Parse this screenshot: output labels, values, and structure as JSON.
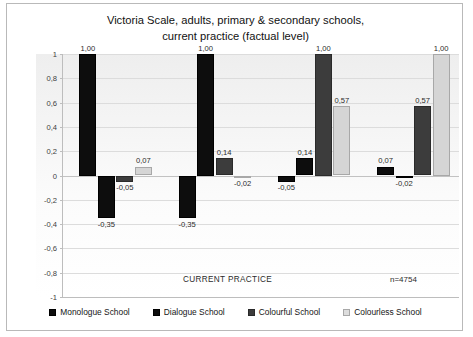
{
  "chart_data": {
    "type": "bar",
    "title": "Victoria Scale, adults, primary & secondary schools, current practice (factual level)",
    "title_lines": [
      "Victoria Scale, adults, primary & secondary schools,",
      "current practice (factual level)"
    ],
    "xlabel": "",
    "ylabel": "",
    "ylim": [
      -1,
      1
    ],
    "ytick_labels": [
      "1",
      "0,8",
      "0,6",
      "0,4",
      "0,2",
      "0",
      "-0,2",
      "-0,4",
      "-0,6",
      "-0,8",
      "-1"
    ],
    "ytick_values": [
      1,
      0.8,
      0.6,
      0.4,
      0.2,
      0,
      -0.2,
      -0.4,
      -0.6,
      -0.8,
      -1
    ],
    "grid": true,
    "legend_position": "bottom",
    "categories": [
      "Monologue School",
      "Dialogue School",
      "Colourful School",
      "Colourless School"
    ],
    "series": [
      {
        "name": "Monologue School",
        "color": "#0d0d0d",
        "values": [
          1.0,
          -0.35,
          -0.05,
          0.07
        ],
        "labels": [
          "1,00",
          "-0,35",
          "-0,05",
          "0,07"
        ]
      },
      {
        "name": "Dialogue School",
        "color": "#0d0d0d",
        "values": [
          -0.35,
          1.0,
          0.14,
          -0.02
        ],
        "labels": [
          "-0,35",
          "1,00",
          "0,14",
          "-0,02"
        ]
      },
      {
        "name": "Colourful School",
        "color": "#3c3c3c",
        "values": [
          -0.05,
          0.14,
          1.0,
          0.57
        ],
        "labels": [
          "-0,05",
          "0,14",
          "1,00",
          "0,57"
        ]
      },
      {
        "name": "Colourless School",
        "color": "#d5d5d5",
        "values": [
          0.07,
          -0.02,
          0.57,
          1.0
        ],
        "labels": [
          "0,07",
          "-0,02",
          "0,57",
          "1,00"
        ]
      }
    ],
    "annotations": [
      {
        "name": "current-practice",
        "text": "CURRENT PRACTICE"
      },
      {
        "name": "sample-size",
        "text": "n=4754"
      }
    ]
  }
}
